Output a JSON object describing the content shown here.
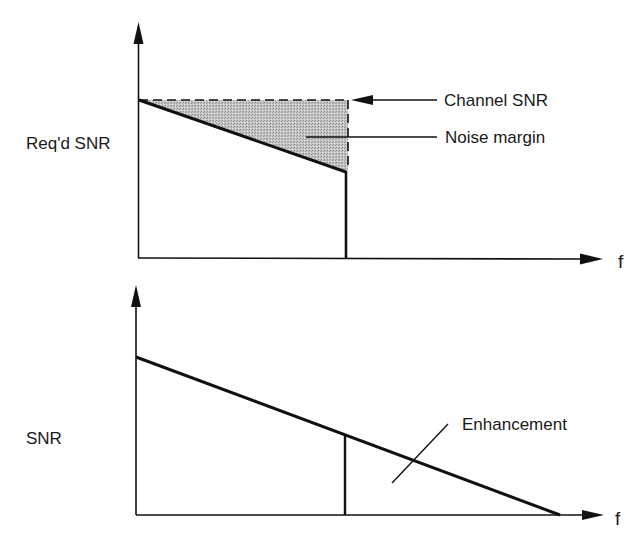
{
  "diagram": {
    "top_panel": {
      "y_axis_label": "Req'd SNR",
      "x_axis_label": "f",
      "annotations": {
        "channel_snr": "Channel SNR",
        "noise_margin": "Noise margin"
      }
    },
    "bottom_panel": {
      "y_axis_label": "SNR",
      "x_axis_label": "f",
      "annotations": {
        "enhancement": "Enhancement"
      }
    },
    "colors": {
      "line": "#111111",
      "noise_margin_fill": "#bdbdbd",
      "background": "#ffffff"
    }
  }
}
